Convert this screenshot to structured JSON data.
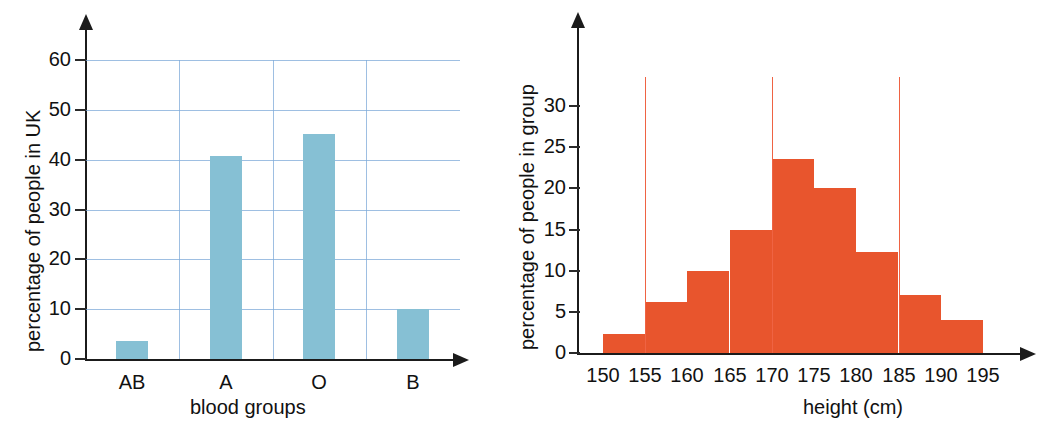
{
  "chart_data": [
    {
      "id": "blood-groups",
      "type": "bar",
      "title": "",
      "xlabel": "blood groups",
      "ylabel": "percentage of people in UK",
      "categories": [
        "AB",
        "A",
        "O",
        "B"
      ],
      "values": [
        3.7,
        40.7,
        45.2,
        10.0
      ],
      "ytick_labels": [
        "0",
        "10",
        "20",
        "30",
        "40",
        "50",
        "60"
      ],
      "ytick_values": [
        0,
        10,
        20,
        30,
        40,
        50,
        60
      ],
      "ylim": [
        0,
        62
      ],
      "grid": "horizontal-and-vertical",
      "legend": "none",
      "bar_color": "#86c0d4",
      "grid_color": "#7ea9d8"
    },
    {
      "id": "height-distribution",
      "type": "bar",
      "title": "",
      "xlabel": "height (cm)",
      "ylabel": "percentage of people in group",
      "categories": [
        "150-155",
        "155-160",
        "160-165",
        "165-170",
        "170-175",
        "175-180",
        "180-185",
        "185-190",
        "190-195"
      ],
      "values": [
        2.3,
        6.2,
        10.0,
        15.0,
        23.6,
        20.0,
        12.3,
        7.0,
        4.0
      ],
      "bin_edges": [
        150,
        155,
        160,
        165,
        170,
        175,
        180,
        185,
        190,
        195
      ],
      "xtick_labels": [
        "150",
        "155",
        "160",
        "165",
        "170",
        "175",
        "180",
        "185",
        "190",
        "195"
      ],
      "xtick_values": [
        150,
        155,
        160,
        165,
        170,
        175,
        180,
        185,
        190,
        195
      ],
      "ytick_labels": [
        "0",
        "5",
        "10",
        "15",
        "20",
        "25",
        "30"
      ],
      "ytick_values": [
        0,
        5,
        10,
        15,
        20,
        25,
        30
      ],
      "ylim": [
        0,
        34
      ],
      "xlim": [
        150,
        195
      ],
      "reference_lines": [
        155,
        170,
        185
      ],
      "grid": "none",
      "legend": "none",
      "bar_color": "#e8552d",
      "reference_line_color": "#ef6343"
    }
  ],
  "left_chart": {
    "ylabel": "percentage of people in UK",
    "xlabel": "blood groups",
    "yticks": [
      {
        "label": "60",
        "value": 60
      },
      {
        "label": "50",
        "value": 50
      },
      {
        "label": "40",
        "value": 40
      },
      {
        "label": "30",
        "value": 30
      },
      {
        "label": "20",
        "value": 20
      },
      {
        "label": "10",
        "value": 10
      },
      {
        "label": "0",
        "value": 0
      }
    ],
    "bars": [
      {
        "label": "AB",
        "value": 3.7
      },
      {
        "label": "A",
        "value": 40.7
      },
      {
        "label": "O",
        "value": 45.2
      },
      {
        "label": "B",
        "value": 10.0
      }
    ]
  },
  "right_chart": {
    "ylabel": "percentage of people in group",
    "xlabel": "height (cm)",
    "yticks": [
      {
        "label": "30",
        "value": 30
      },
      {
        "label": "25",
        "value": 25
      },
      {
        "label": "20",
        "value": 20
      },
      {
        "label": "15",
        "value": 15
      },
      {
        "label": "10",
        "value": 10
      },
      {
        "label": "5",
        "value": 5
      },
      {
        "label": "0",
        "value": 0
      }
    ],
    "xticks": [
      {
        "label": "150",
        "value": 150
      },
      {
        "label": "155",
        "value": 155
      },
      {
        "label": "160",
        "value": 160
      },
      {
        "label": "165",
        "value": 165
      },
      {
        "label": "170",
        "value": 170
      },
      {
        "label": "175",
        "value": 175
      },
      {
        "label": "180",
        "value": 180
      },
      {
        "label": "185",
        "value": 185
      },
      {
        "label": "190",
        "value": 190
      },
      {
        "label": "195",
        "value": 195
      }
    ],
    "bins": [
      {
        "from": 150,
        "to": 155,
        "value": 2.3
      },
      {
        "from": 155,
        "to": 160,
        "value": 6.2
      },
      {
        "from": 160,
        "to": 165,
        "value": 10.0
      },
      {
        "from": 165,
        "to": 170,
        "value": 15.0
      },
      {
        "from": 170,
        "to": 175,
        "value": 23.6
      },
      {
        "from": 175,
        "to": 180,
        "value": 20.0
      },
      {
        "from": 180,
        "to": 185,
        "value": 12.3
      },
      {
        "from": 185,
        "to": 190,
        "value": 7.0
      },
      {
        "from": 190,
        "to": 195,
        "value": 4.0
      }
    ],
    "reference_lines": [
      155,
      170,
      185
    ]
  }
}
